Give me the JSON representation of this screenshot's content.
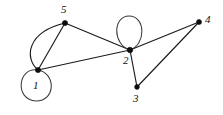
{
  "diagram": {
    "background_color": "#ffffff",
    "edge_color": "#1a1a1a",
    "vertex_color": "#0d0d0d",
    "width": 223,
    "height": 115
  },
  "nodes": [
    {
      "id": "1",
      "label": "1",
      "x": 38,
      "y": 70,
      "label_x": 33,
      "label_y": 80
    },
    {
      "id": "2",
      "label": "2",
      "x": 130,
      "y": 50,
      "label_x": 123,
      "label_y": 55
    },
    {
      "id": "3",
      "label": "3",
      "x": 137,
      "y": 87,
      "label_x": 133,
      "label_y": 93
    },
    {
      "id": "4",
      "label": "4",
      "x": 199,
      "y": 22,
      "label_x": 205,
      "label_y": 14
    },
    {
      "id": "5",
      "label": "5",
      "x": 65,
      "y": 23,
      "label_x": 61,
      "label_y": 4
    }
  ],
  "edges": [
    {
      "from": "1",
      "to": "5",
      "kind": "curve",
      "note": "left-bulging arc"
    },
    {
      "from": "1",
      "to": "5",
      "kind": "line",
      "note": "straight chord"
    },
    {
      "from": "1",
      "to": "2",
      "kind": "line",
      "note": "long lower span"
    },
    {
      "from": "5",
      "to": "2",
      "kind": "line",
      "note": "upper span"
    },
    {
      "from": "2",
      "to": "3",
      "kind": "line",
      "note": "short downward"
    },
    {
      "from": "2",
      "to": "4",
      "kind": "line",
      "note": "upper right span"
    },
    {
      "from": "3",
      "to": "4",
      "kind": "line",
      "note": "right diagonal"
    }
  ],
  "self_loops": [
    {
      "at": "1",
      "shape": "circle",
      "direction": "below-left",
      "radius": 16
    },
    {
      "at": "2",
      "shape": "ellipse",
      "direction": "above",
      "rx": 10,
      "ry": 17
    }
  ],
  "paths": {
    "loop1": "M 38 70 C 18 66 14 100 36 101 C 56 101 56 73 38 70 Z",
    "loop2": "M 130 50 C 112 44 113 16 129 16 C 146 16 146 45 130 50 Z",
    "edge_1_5_curve": "M 38 70 C 24 58 27 32 65 23",
    "edge_1_5_line": "M 38 70 L 65 23",
    "edge_1_2": "M 38 70 L 130 50",
    "edge_5_2": "M 65 23 L 130 50",
    "edge_2_3": "M 130 50 L 137 87",
    "edge_2_4": "M 130 50 L 199 22",
    "edge_3_4": "M 137 87 L 199 22"
  }
}
